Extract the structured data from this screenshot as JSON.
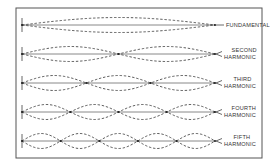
{
  "diagram": {
    "frame": {
      "x": 16,
      "y": 8,
      "width": 246,
      "height": 150
    },
    "string": {
      "x_start": 22,
      "x_end": 215,
      "amplitude": 7.5
    },
    "modes": [
      {
        "key": "fundamental",
        "loops": 1,
        "y": 25,
        "label_lines": [
          "FUNDAMENTAL"
        ]
      },
      {
        "key": "second",
        "loops": 2,
        "y": 54,
        "label_lines": [
          "SECOND",
          "HARMONIC"
        ]
      },
      {
        "key": "third",
        "loops": 3,
        "y": 83,
        "label_lines": [
          "THIRD",
          "HARMONIC"
        ]
      },
      {
        "key": "fourth",
        "loops": 4,
        "y": 112,
        "label_lines": [
          "FOURTH",
          "HARMONIC"
        ]
      },
      {
        "key": "fifth",
        "loops": 5,
        "y": 141,
        "label_lines": [
          "FIFTH",
          "HARMONIC"
        ]
      }
    ],
    "colors": {
      "line": "#444444",
      "frame": "#555555",
      "text": "#333333",
      "background": "#ffffff"
    }
  }
}
